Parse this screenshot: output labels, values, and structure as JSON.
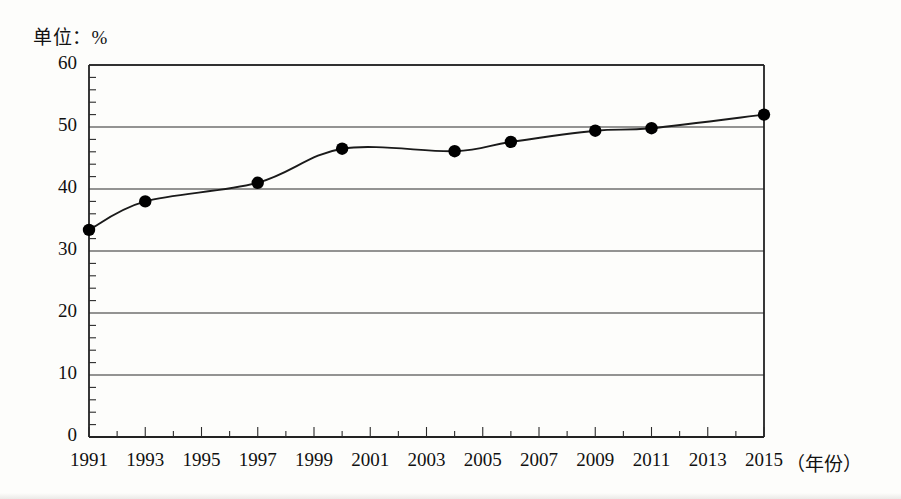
{
  "figure": {
    "unit_label": "单位：%",
    "x_axis_title": "（年份）"
  },
  "chart_data": {
    "type": "line",
    "title": "",
    "subtitle": "",
    "unit_note": "单位：%",
    "xlabel": "（年份）",
    "ylabel": "%",
    "xlim": [
      1991,
      2015
    ],
    "ylim": [
      0,
      60
    ],
    "grid": true,
    "grid_axis": "y",
    "legend": false,
    "legend_position": "none",
    "y_major_ticks": [
      0,
      10,
      20,
      30,
      40,
      50,
      60
    ],
    "y_tick_labels": [
      "0",
      "10",
      "20",
      "30",
      "40",
      "50",
      "60"
    ],
    "y_minor_tick_step": 2,
    "x_major_ticks": [
      1991,
      1993,
      1995,
      1997,
      1999,
      2001,
      2003,
      2005,
      2007,
      2009,
      2011,
      2013,
      2015
    ],
    "x_tick_labels": [
      "1991",
      "1993",
      "1995",
      "1997",
      "1999",
      "2001",
      "2003",
      "2005",
      "2007",
      "2009",
      "2011",
      "2013",
      "2015"
    ],
    "x_minor_tick_step": 1,
    "marker": "filled-circle",
    "line_color": "#1a1a1a",
    "marker_color": "#000000",
    "series": [
      {
        "name": "比重",
        "x": [
          1991,
          1993,
          1997,
          2000,
          2004,
          2006,
          2009,
          2011,
          2015
        ],
        "values": [
          33.4,
          38.0,
          41.0,
          46.5,
          46.1,
          47.6,
          49.4,
          49.8,
          52.0
        ]
      }
    ],
    "points": [
      {
        "year": 1991,
        "value": 33.4
      },
      {
        "year": 1993,
        "value": 38.0
      },
      {
        "year": 1997,
        "value": 41.0
      },
      {
        "year": 2000,
        "value": 46.5
      },
      {
        "year": 2004,
        "value": 46.1
      },
      {
        "year": 2006,
        "value": 47.6
      },
      {
        "year": 2009,
        "value": 49.4
      },
      {
        "year": 2011,
        "value": 49.8
      },
      {
        "year": 2015,
        "value": 52.0
      }
    ]
  }
}
